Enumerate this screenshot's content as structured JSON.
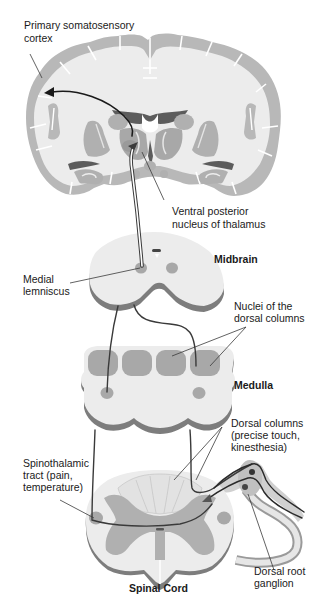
{
  "colors": {
    "background": "#ffffff",
    "white_matter": "#ebebeb",
    "gray_matter": "#b4b4b4",
    "nuclei": "#a8a8a8",
    "ventricle": "#5a5a5a",
    "section_edge": "#7a7a7a",
    "pathway": "#333333",
    "pointer_line": "#3a3a3a"
  },
  "structures": {
    "cortex": "Brain coronal section",
    "midbrain": "Midbrain",
    "medulla": "Medulla",
    "spinal_cord": "Spinal Cord"
  },
  "labels": {
    "primary_somatosensory_cortex": [
      "Primary somatosensory",
      "cortex"
    ],
    "ventral_posterior_nucleus": [
      "Ventral posterior",
      "nucleus of thalamus"
    ],
    "midbrain": "Midbrain",
    "medial_lemniscus": [
      "Medial",
      "lemniscus"
    ],
    "nuclei_dorsal_columns": [
      "Nuclei of the",
      "dorsal columns"
    ],
    "medulla": "Medulla",
    "dorsal_columns": [
      "Dorsal columns",
      "(precise touch,",
      "kinesthesia)"
    ],
    "spinothalamic_tract": [
      "Spinothalamic",
      "tract (pain,",
      "temperature)"
    ],
    "dorsal_root_ganglion": [
      "Dorsal root",
      "ganglion"
    ],
    "spinal_cord": "Spinal Cord"
  }
}
